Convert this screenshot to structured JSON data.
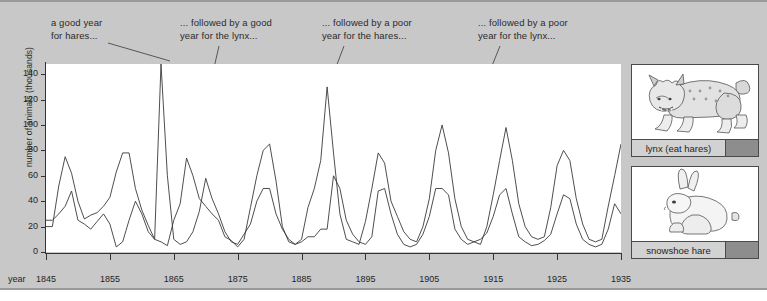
{
  "chart_data": {
    "type": "line",
    "title": "",
    "subtitle": "",
    "xlabel": "year",
    "ylabel": "number of animals (thousands)",
    "xlim": [
      1845,
      1935
    ],
    "ylim": [
      0,
      148
    ],
    "grid": false,
    "legend_position": "right",
    "x_ticks": [
      1845,
      1855,
      1865,
      1875,
      1885,
      1895,
      1905,
      1915,
      1925,
      1935
    ],
    "y_ticks": [
      0,
      20,
      40,
      60,
      80,
      100,
      120,
      140
    ],
    "x": [
      1845,
      1846,
      1847,
      1848,
      1849,
      1850,
      1851,
      1852,
      1853,
      1854,
      1855,
      1856,
      1857,
      1858,
      1859,
      1860,
      1861,
      1862,
      1863,
      1864,
      1865,
      1866,
      1867,
      1868,
      1869,
      1870,
      1871,
      1872,
      1873,
      1874,
      1875,
      1876,
      1877,
      1878,
      1879,
      1880,
      1881,
      1882,
      1883,
      1884,
      1885,
      1886,
      1887,
      1888,
      1889,
      1890,
      1891,
      1892,
      1893,
      1894,
      1895,
      1896,
      1897,
      1898,
      1899,
      1900,
      1901,
      1902,
      1903,
      1904,
      1905,
      1906,
      1907,
      1908,
      1909,
      1910,
      1911,
      1912,
      1913,
      1914,
      1915,
      1916,
      1917,
      1918,
      1919,
      1920,
      1921,
      1922,
      1923,
      1924,
      1925,
      1926,
      1927,
      1928,
      1929,
      1930,
      1931,
      1932,
      1933,
      1934,
      1935
    ],
    "series": [
      {
        "name": "snowshoe hare",
        "values": [
          20,
          20,
          52,
          75,
          62,
          40,
          26,
          29,
          31,
          36,
          43,
          63,
          78,
          78,
          50,
          33,
          21,
          10,
          8,
          5,
          25,
          38,
          74,
          60,
          42,
          36,
          30,
          25,
          12,
          9,
          4,
          10,
          35,
          60,
          80,
          85,
          56,
          20,
          8,
          6,
          10,
          35,
          50,
          72,
          130,
          78,
          30,
          10,
          8,
          6,
          24,
          50,
          78,
          70,
          40,
          28,
          16,
          10,
          8,
          20,
          42,
          80,
          100,
          78,
          42,
          20,
          10,
          8,
          6,
          20,
          45,
          72,
          98,
          72,
          38,
          20,
          12,
          10,
          12,
          35,
          68,
          80,
          72,
          42,
          22,
          10,
          8,
          10,
          36,
          60,
          85
        ]
      },
      {
        "name": "lynx (eat hares)",
        "values": [
          25,
          25,
          30,
          36,
          48,
          25,
          22,
          18,
          24,
          30,
          22,
          4,
          8,
          25,
          40,
          30,
          16,
          10,
          148,
          60,
          10,
          6,
          8,
          16,
          32,
          58,
          42,
          30,
          16,
          8,
          6,
          14,
          22,
          40,
          50,
          50,
          30,
          18,
          10,
          6,
          8,
          12,
          12,
          18,
          18,
          60,
          50,
          25,
          14,
          8,
          6,
          12,
          48,
          50,
          30,
          14,
          6,
          4,
          6,
          14,
          28,
          50,
          50,
          45,
          18,
          10,
          6,
          8,
          10,
          15,
          28,
          45,
          50,
          30,
          12,
          8,
          5,
          6,
          9,
          14,
          30,
          45,
          42,
          22,
          10,
          6,
          4,
          6,
          18,
          38,
          30
        ]
      }
    ],
    "annotations": [
      {
        "id": "a1",
        "line1": "a good year",
        "line2": "for hares..."
      },
      {
        "id": "a2",
        "line1": "... followed by a good",
        "line2": "year for the lynx..."
      },
      {
        "id": "a3",
        "line1": "... followed by a poor",
        "line2": "year for the hares..."
      },
      {
        "id": "a4",
        "line1": "... followed by a poor",
        "line2": "year for the lynx..."
      }
    ]
  },
  "legend": {
    "cards": [
      {
        "label": "lynx (eat hares)",
        "icon": "lynx-illustration",
        "swatch": "#8d8d8d"
      },
      {
        "label": "snowshoe hare",
        "icon": "hare-illustration",
        "swatch": "#8d8d8d"
      }
    ]
  },
  "colors": {
    "background": "#c8c8c8",
    "plot_background": "#ffffff",
    "line": "#3a3a3a",
    "axis": "#333333",
    "text": "#1f1f1f",
    "legend_name_bg": "#d2d2d2",
    "legend_swatch": "#8d8d8d"
  }
}
